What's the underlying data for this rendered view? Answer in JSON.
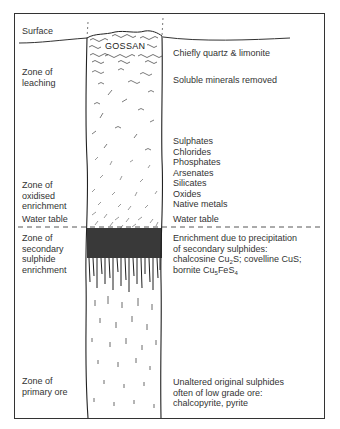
{
  "diagram": {
    "type": "supergene enrichment profile of an ore body",
    "column_label": "GOSSAN",
    "left_labels": {
      "surface": "Surface",
      "leaching": [
        "Zone of",
        "leaching"
      ],
      "oxidised": [
        "Zone of",
        "oxidised",
        "enrichment"
      ],
      "water_table": "Water table",
      "secondary": [
        "Zone of",
        "secondary",
        "sulphide",
        "enrichment"
      ],
      "primary": [
        "Zone of",
        "primary ore"
      ]
    },
    "right_labels": {
      "gossan_desc": "Chiefly quartz & limonite",
      "leaching_desc": "Soluble minerals removed",
      "oxidised_list": [
        "Sulphates",
        "Chlorides",
        "Phosphates",
        "Arsenates",
        "Silicates",
        "Oxides",
        "Native metals"
      ],
      "water_table": "Water table",
      "secondary_desc_1": "Enrichment due to precipitation",
      "secondary_desc_2": "of secondary sulphides:",
      "secondary_desc_3a": "chalcosine Cu",
      "secondary_desc_3b": "2",
      "secondary_desc_3c": "S; covelline CuS;",
      "secondary_desc_4a": "bornite Cu",
      "secondary_desc_4b": "5",
      "secondary_desc_4c": "FeS",
      "secondary_desc_4d": "4",
      "primary_desc": [
        "Unaltered original sulphides",
        "often of low grade ore:",
        "chalcopyrite, pyrite"
      ]
    },
    "colors": {
      "line": "#2a2a2a",
      "background": "#ffffff"
    }
  }
}
